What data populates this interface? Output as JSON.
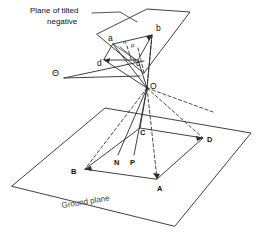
{
  "figure": {
    "background_color": "#ffffff",
    "line_color": "#2b2b2b",
    "text_color": "#111111"
  },
  "annotations": {
    "plane_label_line1": "Plane of tilted",
    "plane_label_line2": "negative",
    "ground_label": "Ground plane",
    "tilt_angle_symbol": "Θ"
  },
  "negative_plane": {
    "points": [
      {
        "id": "a",
        "label": "a",
        "x": 112,
        "y": 40
      },
      {
        "id": "b",
        "label": "b",
        "x": 159,
        "y": 30
      },
      {
        "id": "c",
        "label": "c",
        "x": 139,
        "y": 63
      },
      {
        "id": "d",
        "label": "d",
        "x": 101,
        "y": 64
      },
      {
        "id": "n",
        "label": "n",
        "x": 126,
        "y": 44
      },
      {
        "id": "p",
        "label": "p",
        "x": 133,
        "y": 47
      },
      {
        "id": "o",
        "label": "o",
        "x": 136,
        "y": 60
      }
    ]
  },
  "ground_plane": {
    "points": [
      {
        "id": "A",
        "label": "A",
        "x": 160,
        "y": 183
      },
      {
        "id": "B",
        "label": "B",
        "x": 77,
        "y": 170
      },
      {
        "id": "C",
        "label": "C",
        "x": 142,
        "y": 131
      },
      {
        "id": "D",
        "label": "D",
        "x": 205,
        "y": 139
      },
      {
        "id": "N",
        "label": "N",
        "x": 118,
        "y": 162
      },
      {
        "id": "P",
        "label": "P",
        "x": 134,
        "y": 162
      }
    ]
  },
  "perspective_center": {
    "label": "O",
    "x": 147,
    "y": 88
  }
}
